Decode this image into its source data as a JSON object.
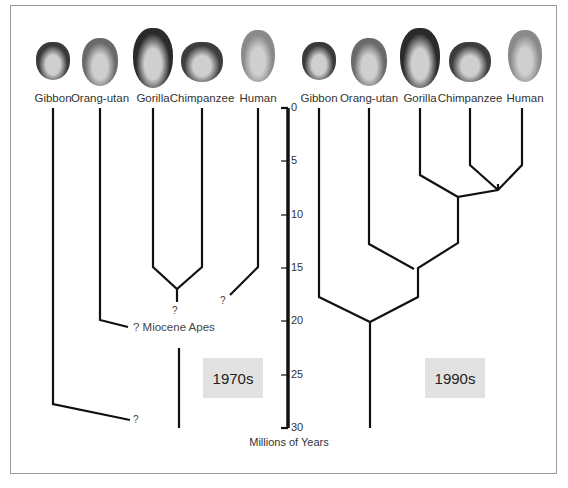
{
  "left_panel": {
    "era_label": "1970s",
    "species": [
      {
        "name": "Gibbon",
        "x": 53
      },
      {
        "name": "Orang-utan",
        "x": 100
      },
      {
        "name": "Gorilla",
        "x": 153
      },
      {
        "name": "Chimpanzee",
        "x": 202
      },
      {
        "name": "Human",
        "x": 258
      }
    ],
    "annotations": {
      "q_chimp_gorilla": "?",
      "q_human": "?",
      "miocene": "? Miocene Apes",
      "q_gibbon": "?"
    }
  },
  "right_panel": {
    "era_label": "1990s",
    "species": [
      {
        "name": "Gibbon",
        "x": 319
      },
      {
        "name": "Orang-utan",
        "x": 369
      },
      {
        "name": "Gorilla",
        "x": 420
      },
      {
        "name": "Chimpanzee",
        "x": 470
      },
      {
        "name": "Human",
        "x": 525
      }
    ]
  },
  "axis": {
    "label": "Millions of Years",
    "ticks": [
      "0",
      "5",
      "10",
      "15",
      "20",
      "25",
      "30"
    ]
  },
  "chart_data": {
    "type": "phylogenetic-tree",
    "title": "",
    "ylabel": "Millions of Years",
    "ylim": [
      0,
      30
    ],
    "trees": [
      {
        "era": "1970s",
        "leaves": [
          "Gibbon",
          "Orang-utan",
          "Gorilla",
          "Chimpanzee",
          "Human"
        ],
        "splits": [
          {
            "taxa": [
              "Gorilla",
              "Chimpanzee"
            ],
            "mya": 17,
            "certain": false
          },
          {
            "taxa": [
              "Human",
              "?"
            ],
            "mya": 18,
            "certain": false
          },
          {
            "taxa": [
              "Orang-utan",
              "Miocene Apes"
            ],
            "mya": 20,
            "certain": false
          },
          {
            "taxa": [
              "Gibbon",
              "?"
            ],
            "mya": 28.5,
            "certain": false
          }
        ]
      },
      {
        "era": "1990s",
        "leaves": [
          "Gibbon",
          "Orang-utan",
          "Gorilla",
          "Chimpanzee",
          "Human"
        ],
        "splits": [
          {
            "taxa": [
              "Chimpanzee",
              "Human"
            ],
            "mya": 7.5
          },
          {
            "taxa": [
              "Gorilla",
              "Chimpanzee+Human"
            ],
            "mya": 8.5
          },
          {
            "taxa": [
              "Orang-utan",
              "African apes"
            ],
            "mya": 15
          },
          {
            "taxa": [
              "Gibbon",
              "Great apes"
            ],
            "mya": 20
          }
        ]
      }
    ]
  }
}
